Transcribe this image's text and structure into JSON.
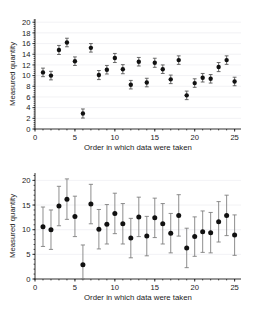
{
  "figure": {
    "background": "#ffffff",
    "point_color": "#111111",
    "errorbar_color": "#7a7a7a",
    "grid_color": "#e9e9ee",
    "axis_color": "#1a1a1a"
  },
  "chart_data": [
    {
      "type": "scatter",
      "panel": "top",
      "title": "",
      "xlabel": "Order in which data were taken",
      "ylabel": "Measured quantity",
      "xlim": [
        0,
        25.8
      ],
      "ylim": [
        0,
        20.6
      ],
      "xticks": [
        0,
        5,
        10,
        15,
        20,
        25
      ],
      "yticks": [
        0,
        2,
        4,
        6,
        8,
        10,
        12,
        14,
        16,
        18,
        20
      ],
      "xticklabels": [
        "0",
        "5",
        "10",
        "15",
        "20",
        "25"
      ],
      "yticklabels": [
        "0",
        "2",
        "4",
        "6",
        "8",
        "10",
        "12",
        "14",
        "16",
        "18",
        "20"
      ],
      "grid": true,
      "grid_axis": "y",
      "legend": "none",
      "error_style": "small",
      "x": [
        1,
        2,
        3,
        4,
        5,
        6,
        7,
        8,
        9,
        10,
        11,
        12,
        13,
        14,
        15,
        16,
        17,
        18,
        19,
        20,
        21,
        22,
        23,
        24,
        25
      ],
      "y": [
        10.6,
        10.0,
        14.8,
        16.2,
        12.7,
        2.9,
        15.2,
        10.1,
        11.1,
        13.3,
        11.2,
        8.3,
        12.6,
        8.7,
        12.4,
        11.2,
        9.3,
        12.9,
        6.3,
        8.6,
        9.6,
        9.4,
        11.6,
        12.9,
        8.9
      ],
      "yerr": [
        0.8,
        0.8,
        0.85,
        0.8,
        0.8,
        0.85,
        0.8,
        0.85,
        0.8,
        0.85,
        0.85,
        0.8,
        0.8,
        0.8,
        0.85,
        0.8,
        0.8,
        0.8,
        0.8,
        0.8,
        0.8,
        0.8,
        0.85,
        0.8,
        0.8
      ]
    },
    {
      "type": "scatter",
      "panel": "bottom",
      "title": "",
      "xlabel": "Order in which data were taken",
      "ylabel": "Measured quantity",
      "xlim": [
        0,
        25.8
      ],
      "ylim": [
        0,
        21.5
      ],
      "xticks": [
        0,
        5,
        10,
        15,
        20,
        25
      ],
      "yticks": [
        0,
        5,
        10,
        15,
        20
      ],
      "xticklabels": [
        "0",
        "5",
        "10",
        "15",
        "20",
        "25"
      ],
      "yticklabels": [
        "0",
        "5",
        "10",
        "15",
        "20"
      ],
      "grid": true,
      "grid_axis": "y",
      "legend": "none",
      "error_style": "large",
      "x": [
        1,
        2,
        3,
        4,
        5,
        6,
        7,
        8,
        9,
        10,
        11,
        12,
        13,
        14,
        15,
        16,
        17,
        18,
        19,
        20,
        21,
        22,
        23,
        24,
        25
      ],
      "y": [
        10.6,
        10.0,
        14.8,
        16.2,
        12.7,
        2.9,
        15.2,
        10.1,
        11.1,
        13.3,
        11.2,
        8.3,
        12.6,
        8.7,
        12.4,
        11.2,
        9.3,
        12.9,
        6.3,
        8.6,
        9.6,
        9.4,
        11.6,
        12.9,
        8.9
      ],
      "yerr": [
        4.0,
        4.0,
        4.0,
        4.1,
        4.1,
        4.0,
        4.0,
        4.0,
        4.0,
        4.1,
        4.1,
        4.0,
        4.0,
        4.0,
        4.0,
        4.1,
        4.0,
        4.2,
        4.0,
        4.0,
        4.2,
        4.1,
        4.1,
        4.1,
        4.1
      ]
    }
  ]
}
